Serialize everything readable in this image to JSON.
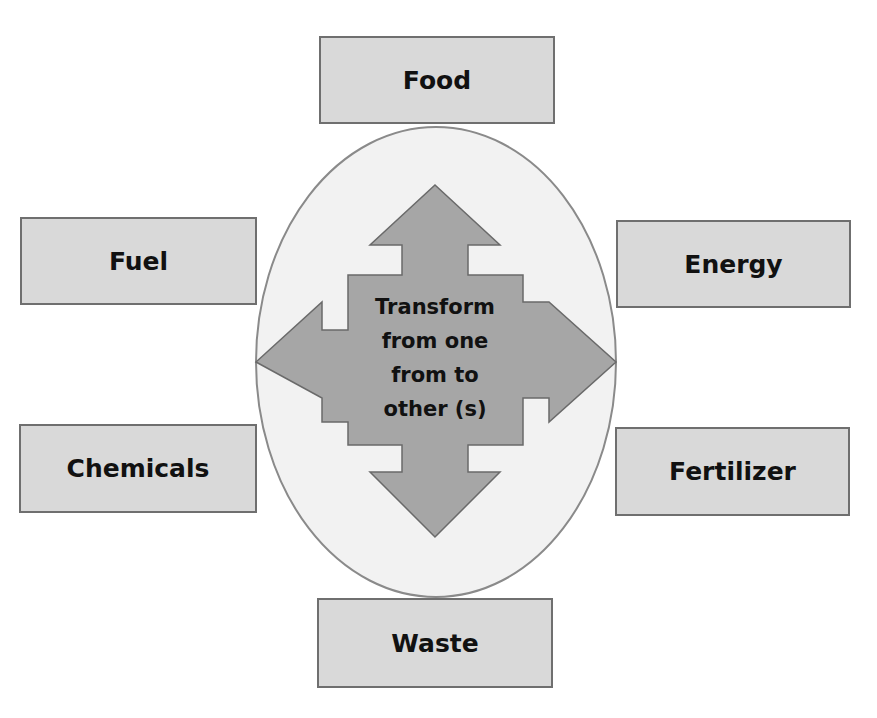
{
  "diagram": {
    "center": {
      "lines": [
        "Transform",
        "from one",
        "from to",
        "other (s)"
      ]
    },
    "nodes": {
      "top": "Food",
      "left_upper": "Fuel",
      "right_upper": "Energy",
      "left_lower": "Chemicals",
      "right_lower": "Fertilizer",
      "bottom": "Waste"
    },
    "colors": {
      "box_fill": "#d9d9d9",
      "box_border": "#6f6f6f",
      "ellipse_fill": "#f2f2f2",
      "arrow_fill": "#a6a6a6"
    }
  }
}
